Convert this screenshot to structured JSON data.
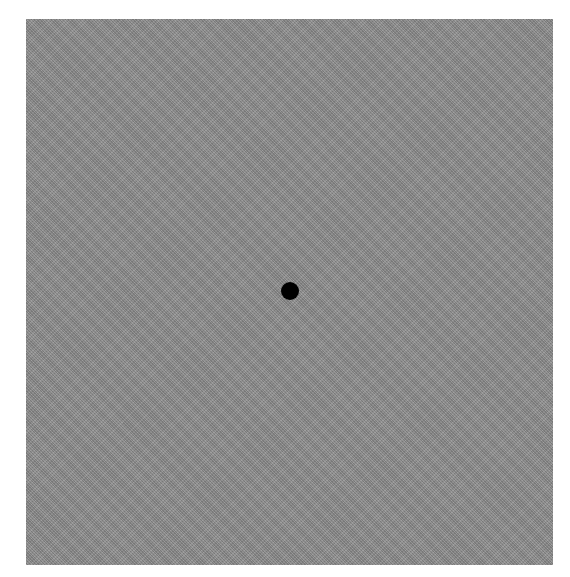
{
  "stimulus": {
    "field": {
      "description": "noise-textured gray square",
      "color": "#8a8a8a",
      "left": 26,
      "top": 19,
      "width": 527,
      "height": 546
    },
    "fixation_dot": {
      "color": "#000000",
      "center_x": 290,
      "center_y": 291,
      "radius": 9
    },
    "background_color": "#ffffff"
  }
}
